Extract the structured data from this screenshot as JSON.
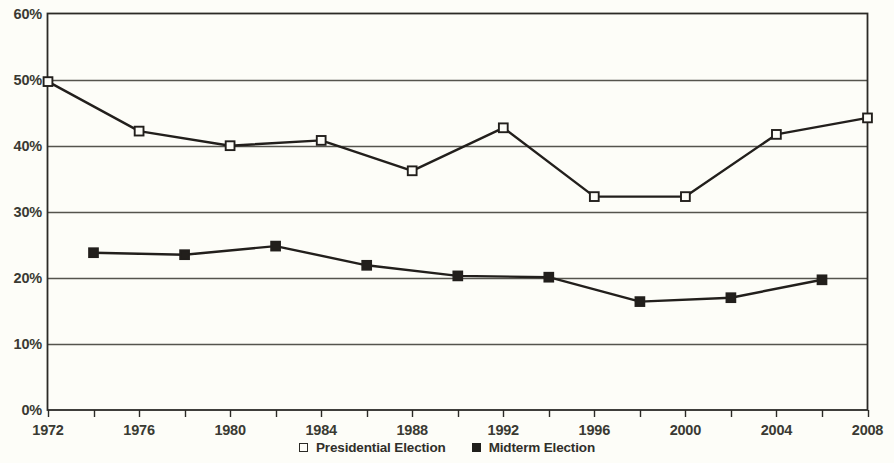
{
  "chart_data": {
    "type": "line",
    "title": "",
    "subtitle": "",
    "xlabel": "",
    "ylabel": "",
    "x": [
      1972,
      1974,
      1976,
      1978,
      1980,
      1982,
      1984,
      1986,
      1988,
      1990,
      1992,
      1994,
      1996,
      1998,
      2000,
      2002,
      2004,
      2006,
      2008
    ],
    "xlim": [
      1972,
      2008
    ],
    "ylim": [
      0,
      60
    ],
    "x_tick_labels": [
      "1972",
      "1976",
      "1980",
      "1984",
      "1988",
      "1992",
      "1996",
      "2000",
      "2004",
      "2008"
    ],
    "x_ticks": [
      1972,
      1976,
      1980,
      1984,
      1988,
      1992,
      1996,
      2000,
      2004,
      2008
    ],
    "x_minor_ticks": [
      1974,
      1978,
      1982,
      1986,
      1990,
      1994,
      1998,
      2002,
      2006
    ],
    "y_tick_labels": [
      "0%",
      "10%",
      "20%",
      "30%",
      "40%",
      "50%",
      "60%"
    ],
    "y_ticks": [
      0,
      10,
      20,
      30,
      40,
      50,
      60
    ],
    "grid": "horizontal",
    "legend_position": "bottom-center",
    "series": [
      {
        "name": "Presidential Election",
        "marker": "open-square",
        "color": "#221f1c",
        "points": [
          {
            "x": 1972,
            "y": 49.7
          },
          {
            "x": 1976,
            "y": 42.2
          },
          {
            "x": 1980,
            "y": 40.0
          },
          {
            "x": 1984,
            "y": 40.8
          },
          {
            "x": 1988,
            "y": 36.2
          },
          {
            "x": 1992,
            "y": 42.7
          },
          {
            "x": 1996,
            "y": 32.3
          },
          {
            "x": 2000,
            "y": 32.3
          },
          {
            "x": 2004,
            "y": 41.7
          },
          {
            "x": 2008,
            "y": 44.2
          }
        ]
      },
      {
        "name": "Midterm Election",
        "marker": "filled-square",
        "color": "#221f1c",
        "points": [
          {
            "x": 1974,
            "y": 23.8
          },
          {
            "x": 1978,
            "y": 23.5
          },
          {
            "x": 1982,
            "y": 24.8
          },
          {
            "x": 1986,
            "y": 21.9
          },
          {
            "x": 1990,
            "y": 20.3
          },
          {
            "x": 1994,
            "y": 20.1
          },
          {
            "x": 1998,
            "y": 16.4
          },
          {
            "x": 2002,
            "y": 17.0
          },
          {
            "x": 2006,
            "y": 19.7
          }
        ]
      }
    ]
  },
  "legend": {
    "items": [
      {
        "label": "Presidential Election",
        "marker": "open-square"
      },
      {
        "label": "Midterm Election",
        "marker": "filled-square"
      }
    ]
  },
  "colors": {
    "background": "#fdfdf8",
    "axis": "#2b2a26",
    "gridline": "#55544d",
    "series_line": "#221f1c",
    "tick_text": "#3a3a33"
  }
}
